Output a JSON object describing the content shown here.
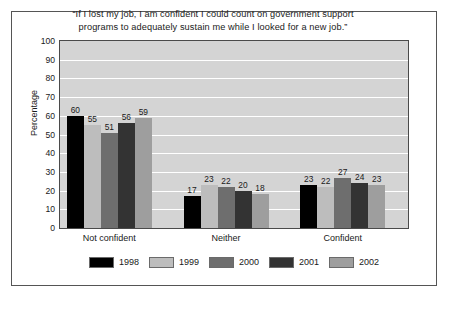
{
  "chart_data": {
    "type": "bar",
    "title": "“If I lost my job, I am confident I could count on government support programs to adequately sustain me while I looked for a new job.”",
    "title_line1": "“If I lost my job, I am confident I could count on government support",
    "title_line2": "programs to adequately sustain me while I looked for a new job.”",
    "xlabel": "",
    "ylabel": "Percentage",
    "ylim": [
      0,
      100
    ],
    "ytick_step": 10,
    "yticks": [
      100,
      90,
      80,
      70,
      60,
      50,
      40,
      30,
      20,
      10,
      0
    ],
    "grid": true,
    "grid_axis": "y",
    "legend_position": "bottom",
    "categories": [
      "Not confident",
      "Neither",
      "Confident"
    ],
    "series": [
      {
        "name": "1998",
        "color": "#000000",
        "values": [
          60,
          17,
          23
        ]
      },
      {
        "name": "1999",
        "color": "#bdbdbd",
        "values": [
          55,
          23,
          22
        ]
      },
      {
        "name": "2000",
        "color": "#6e6e6e",
        "values": [
          51,
          22,
          27
        ]
      },
      {
        "name": "2001",
        "color": "#333333",
        "values": [
          56,
          20,
          24
        ]
      },
      {
        "name": "2002",
        "color": "#9e9e9e",
        "values": [
          59,
          18,
          23
        ]
      }
    ],
    "data_labels": true,
    "plot_background": "#d4d4d4",
    "gridline_color": "#ffffff",
    "page_background": "#ffffff",
    "frame_color": "#555555"
  }
}
